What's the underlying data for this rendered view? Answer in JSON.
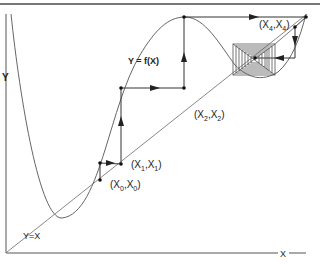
{
  "figure": {
    "axis_y_label": "Y",
    "axis_x_label": "X",
    "curve_label": "Y = f(X)",
    "diagonal_label": "Y=X",
    "points": [
      {
        "id": "x0",
        "label_main": "(X",
        "sub1": "0",
        "mid": ",X",
        "sub2": "0",
        "close": ")"
      },
      {
        "id": "x1",
        "label_main": "(X",
        "sub1": "1",
        "mid": ",X",
        "sub2": "1",
        "close": ")"
      },
      {
        "id": "x2",
        "label_main": "(X",
        "sub1": "2",
        "mid": ",X",
        "sub2": "2",
        "close": ")"
      },
      {
        "id": "x4",
        "label_main": "(X",
        "sub1": "4",
        "mid": ",X",
        "sub2": "4",
        "close": ")"
      }
    ],
    "colors": {
      "line": "#555555",
      "curve": "#666666",
      "text": "#222222",
      "border": "#777777"
    }
  }
}
